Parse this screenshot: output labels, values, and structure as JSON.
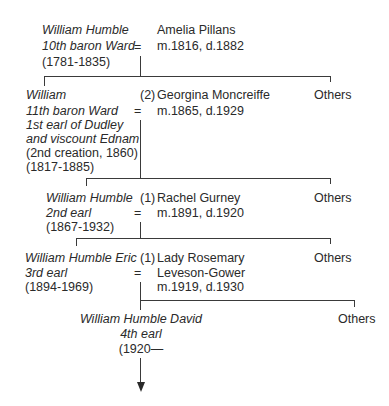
{
  "generations": [
    {
      "person": {
        "name": "William Humble",
        "title_lines": [
          "10th baron Ward"
        ],
        "extra_lines": [],
        "dates": "(1781-1835)"
      },
      "marriage_symbol": "=",
      "marriage_number": "",
      "spouse": {
        "name": "Amelia Pillans",
        "name_lines": [
          "Amelia Pillans"
        ],
        "marriage_dates": "m.1816, d.1882"
      },
      "others_label": "Others"
    },
    {
      "person": {
        "name": "William",
        "title_lines": [
          "11th baron Ward",
          "1st earl of Dudley",
          "and viscount Ednam"
        ],
        "extra_lines": [
          "(2nd creation, 1860)"
        ],
        "dates": "(1817-1885)"
      },
      "marriage_symbol": "=",
      "marriage_number": "(2)",
      "spouse": {
        "name": "Georgina Moncreiffe",
        "name_lines": [
          "Georgina Moncreiffe"
        ],
        "marriage_dates": "m.1865, d.1929"
      },
      "others_label": "Others"
    },
    {
      "person": {
        "name": "William Humble",
        "title_lines": [
          "2nd earl"
        ],
        "extra_lines": [],
        "dates": "(1867-1932)"
      },
      "marriage_symbol": "=",
      "marriage_number": "(1)",
      "spouse": {
        "name": "Rachel Gurney",
        "name_lines": [
          "Rachel Gurney"
        ],
        "marriage_dates": "m.1891, d.1920"
      },
      "others_label": "Others"
    },
    {
      "person": {
        "name": "William Humble Eric",
        "title_lines": [
          "3rd earl"
        ],
        "extra_lines": [],
        "dates": "(1894-1969)"
      },
      "marriage_symbol": "=",
      "marriage_number": "(1)",
      "spouse": {
        "name": "Lady Rosemary Leveson-Gower",
        "name_lines": [
          "Lady Rosemary",
          "Leveson-Gower"
        ],
        "marriage_dates": "m.1919, d.1930"
      },
      "others_label": "Others"
    },
    {
      "person": {
        "name": "William Humble David",
        "title_lines": [
          "4th earl"
        ],
        "extra_lines": [],
        "dates": "(1920—"
      }
    }
  ]
}
